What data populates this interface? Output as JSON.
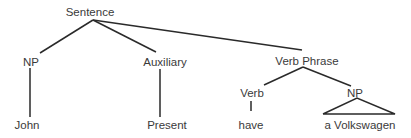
{
  "diagram": {
    "type": "syntax-tree",
    "nodes": {
      "sentence": {
        "label": "Sentence",
        "x": 90,
        "y": 6
      },
      "np1": {
        "label": "NP",
        "x": 31,
        "y": 55
      },
      "auxiliary": {
        "label": "Auxiliary",
        "x": 165,
        "y": 55
      },
      "verb_phrase": {
        "label": "Verb Phrase",
        "x": 307,
        "y": 55
      },
      "john": {
        "label": "John",
        "x": 27,
        "y": 119
      },
      "present": {
        "label": "Present",
        "x": 167,
        "y": 119
      },
      "verb": {
        "label": "Verb",
        "x": 252,
        "y": 87
      },
      "np2": {
        "label": "NP",
        "x": 355,
        "y": 87
      },
      "have": {
        "label": "have",
        "x": 251,
        "y": 119
      },
      "a_volkswagen": {
        "label": "a Volkswagen",
        "x": 360,
        "y": 119
      }
    },
    "edges": [
      [
        "sentence",
        "np1"
      ],
      [
        "sentence",
        "auxiliary"
      ],
      [
        "sentence",
        "verb_phrase"
      ],
      [
        "np1",
        "john"
      ],
      [
        "auxiliary",
        "present"
      ],
      [
        "verb_phrase",
        "verb"
      ],
      [
        "verb_phrase",
        "np2"
      ],
      [
        "verb",
        "have"
      ],
      [
        "np2",
        "a_volkswagen (triangle)"
      ]
    ]
  }
}
